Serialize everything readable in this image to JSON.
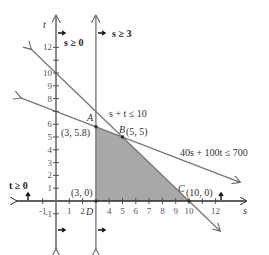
{
  "chart_data": {
    "type": "line",
    "title": "",
    "xlabel": "s",
    "ylabel": "t",
    "xlim": [
      -1.5,
      13.5
    ],
    "ylim": [
      -3.5,
      14
    ],
    "grid": false,
    "x_ticks": [
      -1,
      1,
      2,
      4,
      5,
      6,
      7,
      8,
      9,
      10,
      12
    ],
    "x_tick_labels": [
      "-1",
      "1",
      "2",
      "4",
      "5",
      "6",
      "7",
      "8",
      "9",
      "10",
      "12"
    ],
    "y_ticks": [
      -1,
      1,
      2,
      3,
      4,
      5,
      6,
      8,
      9,
      10,
      12
    ],
    "y_tick_labels": [
      "-1",
      "1",
      "2",
      "3",
      "4",
      "5",
      "6",
      "8",
      "9",
      "10",
      "12"
    ],
    "constraints": [
      {
        "name": "s ≥ 0",
        "type": "vertical",
        "value": 0
      },
      {
        "name": "s ≥ 3",
        "type": "vertical",
        "value": 3
      },
      {
        "name": "t ≥ 0",
        "type": "horizontal",
        "value": 0
      },
      {
        "name": "s + t ≤ 10",
        "type": "line",
        "a": 1,
        "b": 1,
        "c": 10
      },
      {
        "name": "40s + 100t ≤ 700",
        "type": "line",
        "a": 40,
        "b": 100,
        "c": 700
      }
    ],
    "feasible_region": [
      [
        3,
        0
      ],
      [
        3,
        5.8
      ],
      [
        5,
        5
      ],
      [
        10,
        0
      ]
    ],
    "vertices": [
      {
        "label": "A",
        "coords": "(3, 5.8)",
        "s": 3,
        "t": 5.8
      },
      {
        "label": "B",
        "coords": "(5, 5)",
        "s": 5,
        "t": 5
      },
      {
        "label": "C",
        "coords": "(10, 0)",
        "s": 10,
        "t": 0
      },
      {
        "label": "D",
        "coords": "(3, 0)",
        "s": 3,
        "t": 0
      }
    ],
    "shading_color": "#a8a8a8"
  },
  "labels": {
    "axis_s": "s",
    "axis_t": "t",
    "s_ge_0": "s ≥ 0",
    "s_ge_3": "s ≥ 3",
    "t_ge_0": "t ≥ 0",
    "line1": "s + t ≤ 10",
    "line2": "40s + 100t ≤ 700",
    "A": "A",
    "B": "B",
    "C": "C",
    "D": "D",
    "A_coords": "(3, 5.8)",
    "B_coords": "(5, 5)",
    "C_coords": "(10, 0)",
    "D_coords": "(3, 0)"
  }
}
